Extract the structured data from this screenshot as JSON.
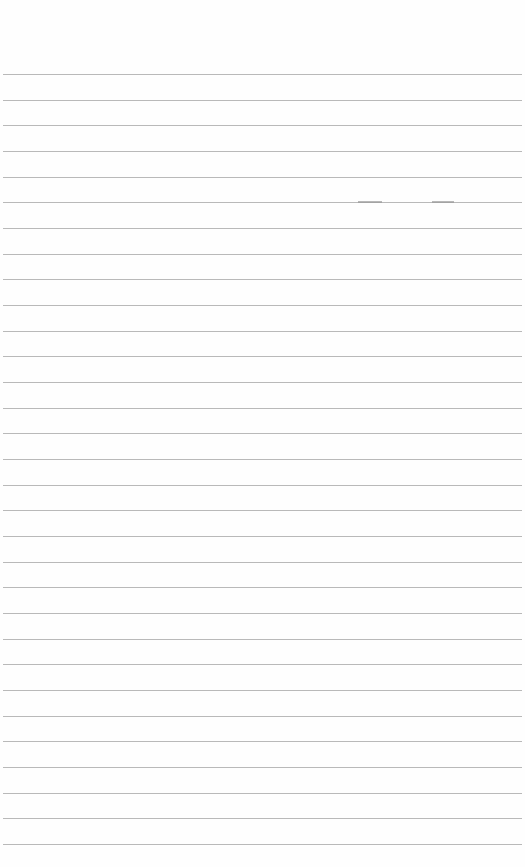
{
  "page": {
    "type": "blank-ruled-paper",
    "line_count": 31,
    "first_line_y": 74,
    "line_spacing": 25.67,
    "line_color": "#b9b9b9",
    "background_color": "#fefefe",
    "text_content": []
  }
}
